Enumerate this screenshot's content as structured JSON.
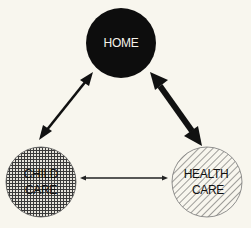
{
  "diagram": {
    "background": "#f8f6ee",
    "nodes": [
      {
        "id": "home",
        "lines": [
          "HOME"
        ],
        "fill": "solid",
        "color": "#0d0d0d",
        "cx": 121,
        "cy": 43,
        "r": 35
      },
      {
        "id": "child-care",
        "lines": [
          "CHILD",
          "CARE"
        ],
        "fill": "crosshatch-grid",
        "color": "#333333",
        "cx": 41,
        "cy": 182,
        "r": 35
      },
      {
        "id": "health-care",
        "lines": [
          "HEALTH",
          "CARE"
        ],
        "fill": "diagonal-hatch",
        "color": "#333333",
        "cx": 207,
        "cy": 182,
        "r": 35
      }
    ],
    "edges": [
      {
        "from": "home",
        "to": "child-care",
        "bidirectional": true,
        "weight": "medium"
      },
      {
        "from": "home",
        "to": "health-care",
        "bidirectional": true,
        "weight": "heavy"
      },
      {
        "from": "child-care",
        "to": "health-care",
        "bidirectional": true,
        "weight": "light"
      }
    ]
  }
}
